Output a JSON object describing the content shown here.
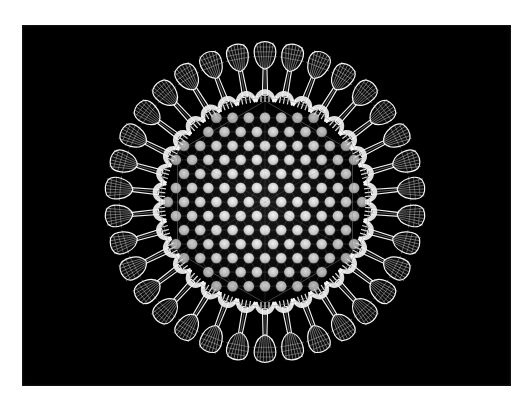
{
  "image": {
    "kind": "scientific-illustration",
    "subject": "virus particle",
    "style": "white wireframe line-art on black background",
    "alt_text": "Wireframe illustration of an icosahedral virus particle with a hexagonal capsomere lattice and radiating club-shaped spike proteins",
    "frame": {
      "border_color": "#ffffff",
      "border_left": 22,
      "border_top": 25,
      "border_right": 20,
      "border_bottom": 22
    },
    "canvas": {
      "width": 531,
      "height": 408,
      "photo_width": 489,
      "photo_height": 361,
      "background_color": "#000000",
      "line_color": "#ffffff"
    }
  },
  "chart_data": {
    "type": "scatter",
    "xlabel": "",
    "ylabel": "",
    "grid": false,
    "legend": "none",
    "center": {
      "x": 243,
      "y": 177
    },
    "capsid": {
      "label": "capsid shell",
      "outer_radius": 124,
      "lattice_type": "hexagonal close-packed capsomeres",
      "capsomere_spacing": 16.2,
      "capsomere_radius": 5.2,
      "capsomere_color": "#d8d8d8",
      "capsomere_count": 167,
      "lattice_line_color": "#6a6a6a",
      "triangulation_edges": 6
    },
    "spikes": {
      "label": "fiber spike proteins",
      "count": 34,
      "stalk_length": 34,
      "knob_width": 26,
      "knob_height": 21,
      "mesh_lines_per_knob": 7,
      "base_band_color": "#f2f2f2"
    },
    "rim_bands": {
      "label": "penton base bands",
      "count": 34,
      "rib_count": 5
    }
  },
  "accessibility": {
    "role": "img",
    "description": "Monochrome diagram of a spherical virus covered in evenly spaced mushroom-shaped spikes"
  }
}
